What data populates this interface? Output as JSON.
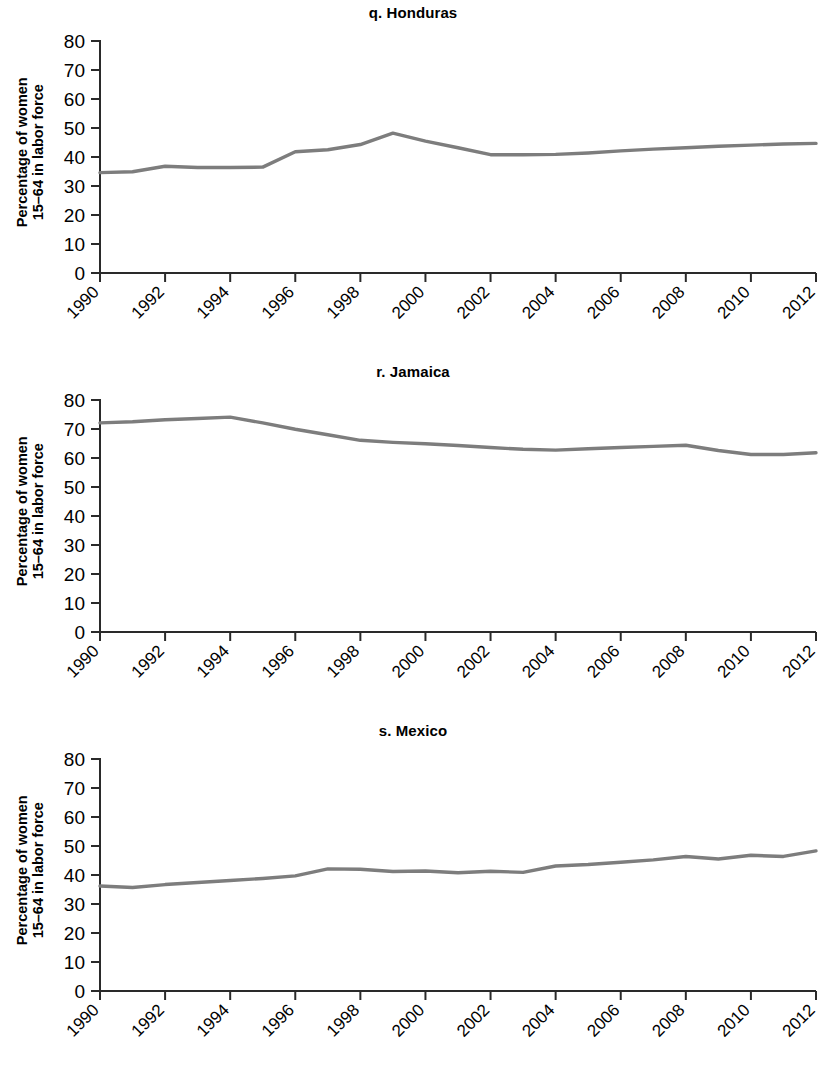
{
  "figure": {
    "line_color": "#7d7d7d",
    "axis_color": "#2a2a2a",
    "background": "#ffffff"
  },
  "panels": [
    {
      "key": "honduras",
      "title": "q. Honduras",
      "ylabel_line1": "Percentage of women",
      "ylabel_line2": "15–64 in labor force"
    },
    {
      "key": "jamaica",
      "title": "r. Jamaica",
      "ylabel_line1": "Percentage of women",
      "ylabel_line2": "15–64 in labor force"
    },
    {
      "key": "mexico",
      "title": "s. Mexico",
      "ylabel_line1": "Percentage of women",
      "ylabel_line2": "15–64 in labor force"
    }
  ],
  "axis": {
    "y_ticks": [
      0,
      10,
      20,
      30,
      40,
      50,
      60,
      70,
      80
    ],
    "y_tick_labels": [
      "0",
      "10",
      "20",
      "30",
      "40",
      "50",
      "60",
      "70",
      "80"
    ],
    "x_ticks": [
      1990,
      1992,
      1994,
      1996,
      1998,
      2000,
      2002,
      2004,
      2006,
      2008,
      2010,
      2012
    ],
    "x_tick_labels": [
      "1990",
      "1992",
      "1994",
      "1996",
      "1998",
      "2000",
      "2002",
      "2004",
      "2006",
      "2008",
      "2010",
      "2012"
    ]
  },
  "chart_data": [
    {
      "type": "line",
      "title": "q. Honduras",
      "xlabel": "",
      "ylabel": "Percentage of women 15–64 in labor force",
      "xlim": [
        1990,
        2012
      ],
      "ylim": [
        0,
        80
      ],
      "grid": false,
      "legend": "none",
      "x": [
        1990,
        1991,
        1992,
        1993,
        1994,
        1995,
        1996,
        1997,
        1998,
        1999,
        2000,
        2001,
        2002,
        2003,
        2004,
        2005,
        2006,
        2007,
        2008,
        2009,
        2010,
        2011,
        2012
      ],
      "values": [
        34.6,
        34.9,
        36.8,
        36.4,
        36.4,
        36.5,
        41.8,
        42.5,
        44.3,
        48.2,
        45.5,
        43.2,
        40.8,
        40.8,
        40.9,
        41.4,
        42.1,
        42.7,
        43.2,
        43.7,
        44.1,
        44.5,
        44.7
      ]
    },
    {
      "type": "line",
      "title": "r. Jamaica",
      "xlabel": "",
      "ylabel": "Percentage of women 15–64 in labor force",
      "xlim": [
        1990,
        2012
      ],
      "ylim": [
        0,
        80
      ],
      "grid": false,
      "legend": "none",
      "x": [
        1990,
        1991,
        1992,
        1993,
        1994,
        1995,
        1996,
        1997,
        1998,
        1999,
        2000,
        2001,
        2002,
        2003,
        2004,
        2005,
        2006,
        2007,
        2008,
        2009,
        2010,
        2011,
        2012
      ],
      "values": [
        72.1,
        72.5,
        73.2,
        73.6,
        74.1,
        72.1,
        69.9,
        68.0,
        66.1,
        65.4,
        64.9,
        64.3,
        63.6,
        63.0,
        62.7,
        63.2,
        63.6,
        64.0,
        64.4,
        62.6,
        61.2,
        61.2,
        61.8
      ]
    },
    {
      "type": "line",
      "title": "s. Mexico",
      "xlabel": "",
      "ylabel": "Percentage of women 15–64 in labor force",
      "xlim": [
        1990,
        2012
      ],
      "ylim": [
        0,
        80
      ],
      "grid": false,
      "legend": "none",
      "x": [
        1990,
        1991,
        1992,
        1993,
        1994,
        1995,
        1996,
        1997,
        1998,
        1999,
        2000,
        2001,
        2002,
        2003,
        2004,
        2005,
        2006,
        2007,
        2008,
        2009,
        2010,
        2011,
        2012
      ],
      "values": [
        36.2,
        35.7,
        36.7,
        37.4,
        38.1,
        38.8,
        39.7,
        42.1,
        42.0,
        41.2,
        41.4,
        40.8,
        41.3,
        40.9,
        43.1,
        43.6,
        44.4,
        45.2,
        46.4,
        45.5,
        46.8,
        46.4,
        48.3
      ]
    }
  ]
}
